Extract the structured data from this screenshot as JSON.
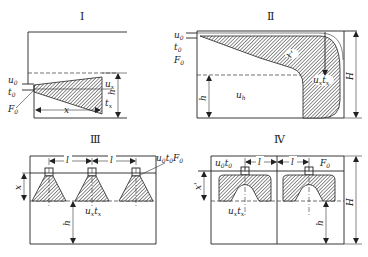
{
  "panels": [
    {
      "id": "I",
      "title": "Ⅰ",
      "labels": {
        "u0": "u",
        "u0_sub": "0",
        "t0": "t",
        "t0_sub": "0",
        "F0": "F",
        "F0_sub": "0",
        "x": "x",
        "ux": "u",
        "ux_sub": "x",
        "tx": "t",
        "tx_sub": "x",
        "h": "h"
      }
    },
    {
      "id": "II",
      "title": "Ⅱ",
      "labels": {
        "u0": "u",
        "u0_sub": "0",
        "t0": "t",
        "t0_sub": "0",
        "F0": "F",
        "F0_sub": "0",
        "xprime": "x'",
        "uxtx": "u",
        "uxtx_sub1": "x",
        "uxtx_t": "t",
        "uxtx_sub2": "x",
        "uh": "u",
        "uh_sub": "h",
        "h": "h",
        "H": "H"
      }
    },
    {
      "id": "III",
      "title": "Ⅲ",
      "labels": {
        "l1": "l",
        "l2": "l",
        "callout": "u",
        "callout_sub0": "0",
        "callout_t": "t",
        "callout_sub1": "0",
        "callout_F": "F",
        "callout_sub2": "0",
        "x": "x",
        "uxtx": "u",
        "uxtx_sub1": "x",
        "uxtx_t": "t",
        "uxtx_sub2": "x",
        "h": "h"
      }
    },
    {
      "id": "IV",
      "title": "Ⅳ",
      "labels": {
        "u0t0": "u",
        "u0t0_sub1": "0",
        "u0t0_t": "t",
        "u0t0_sub2": "0",
        "l1": "l",
        "l2": "l",
        "F0": "F",
        "F0_sub": "0",
        "xprime": "x'",
        "uxtx": "u",
        "uxtx_sub1": "x",
        "uxtx_t": "t",
        "uxtx_sub2": "x",
        "h": "h",
        "H": "H"
      }
    }
  ]
}
